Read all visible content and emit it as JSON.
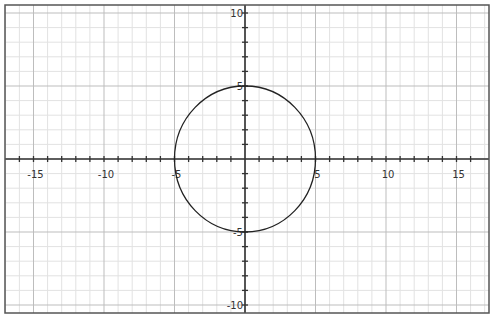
{
  "chart_data": {
    "type": "line",
    "title": "",
    "xlabel": "",
    "ylabel": "",
    "xlim": [
      -17,
      17
    ],
    "ylim": [
      -10.5,
      10.5
    ],
    "grid": true,
    "legend": null,
    "x_ticks": [
      -15,
      -10,
      -5,
      5,
      10,
      15
    ],
    "y_ticks": [
      10,
      5,
      -5,
      -10
    ],
    "x_tick_labels": [
      "-15",
      "-10",
      "-5",
      "5",
      "10",
      "15"
    ],
    "y_tick_labels": [
      "10",
      "5",
      "-5",
      "-10"
    ],
    "series": [
      {
        "name": "circle",
        "equation": "x^2 + y^2 = 25",
        "center": [
          0,
          0
        ],
        "radius": 5
      }
    ],
    "colors": {
      "curve": "#222222",
      "axis": "#333333",
      "minor_grid": "#e2e2e2",
      "major_grid": "#bdbdbd",
      "frame": "#555555"
    }
  }
}
